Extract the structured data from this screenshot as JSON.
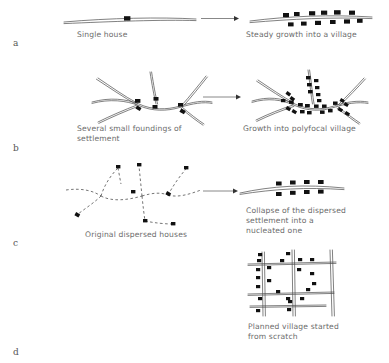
{
  "figure": {
    "background": "#ffffff",
    "ink_color": "#4a4a4a",
    "house_color": "#111111",
    "caption_color": "#6b6b6b",
    "arrow_color": "#6a6a6a"
  },
  "panels": [
    {
      "id": "a",
      "label": "a",
      "label_pos": {
        "x": 13,
        "y": 38
      },
      "before": {
        "caption": "Single house",
        "caption_pos": {
          "x": 77,
          "y": 30
        },
        "house_count": 1,
        "road_type": "solid-double",
        "roads": [
          {
            "d": "M 64 22 C 110 18 160 17 196 19"
          },
          {
            "d": "M 64 23.6 C 112 21.5 162 19.5 196 20.6"
          }
        ],
        "houses": [
          {
            "x": 124,
            "y": 16.2,
            "w": 6.4,
            "h": 4.4,
            "rot": 0
          }
        ]
      },
      "after": {
        "caption": "Steady growth into a village",
        "caption_pos": {
          "x": 246,
          "y": 30
        },
        "house_count": 12,
        "road_type": "solid-double",
        "roads": [
          {
            "d": "M 250 21 C 290 16 330 14.5 372 17"
          },
          {
            "d": "M 250 22.6 C 292 19 332 17 372 18.6"
          }
        ],
        "houses": [
          {
            "x": 283,
            "y": 13.0,
            "w": 6.0,
            "h": 4.2,
            "rot": 0
          },
          {
            "x": 294,
            "y": 12.0,
            "w": 5.6,
            "h": 4.0,
            "rot": 0
          },
          {
            "x": 309,
            "y": 11.2,
            "w": 6.2,
            "h": 4.2,
            "rot": 0
          },
          {
            "x": 321,
            "y": 10.6,
            "w": 6.2,
            "h": 4.2,
            "rot": 0
          },
          {
            "x": 334,
            "y": 10.2,
            "w": 6.6,
            "h": 4.4,
            "rot": 0
          },
          {
            "x": 349,
            "y": 10.6,
            "w": 6.0,
            "h": 4.2,
            "rot": 0
          },
          {
            "x": 288,
            "y": 22.4,
            "w": 5.6,
            "h": 4.0,
            "rot": 0
          },
          {
            "x": 301,
            "y": 21.6,
            "w": 5.6,
            "h": 4.0,
            "rot": 0
          },
          {
            "x": 315,
            "y": 20.8,
            "w": 6.0,
            "h": 4.2,
            "rot": 0
          },
          {
            "x": 330,
            "y": 20.0,
            "w": 5.6,
            "h": 4.0,
            "rot": 0
          },
          {
            "x": 344,
            "y": 19.4,
            "w": 6.0,
            "h": 4.2,
            "rot": 0
          },
          {
            "x": 357,
            "y": 18.8,
            "w": 5.6,
            "h": 4.0,
            "rot": 0
          }
        ]
      },
      "arrow": {
        "x1": 201,
        "y1": 18.5,
        "x2": 239,
        "y2": 18.5
      }
    },
    {
      "id": "b",
      "label": "b",
      "label_pos": {
        "x": 13,
        "y": 143
      },
      "before": {
        "caption": "Several small foundings of\nsettlement",
        "caption_pos": {
          "x": 77,
          "y": 124
        },
        "house_count": 6,
        "road_type": "solid-double-branching",
        "roads": [
          {
            "d": "M 92 102 C 110 97 126 99 139 104 C 152 110 167 110 180 106 C 192 102 204 100 212 102"
          },
          {
            "d": "M 92 103.4 C 110 98.6 126 100.6 139 105.6 C 152 111.4 167 111.4 180 107.4 C 192 103.6 204 101.6 212 103.4"
          },
          {
            "d": "M 98 78 C 110 86 124 96 137 103"
          },
          {
            "d": "M 96.4 79.2 C 109 87.4 123 97 136 104.2"
          },
          {
            "d": "M 150 72 C 152 85 154 96 156 104"
          },
          {
            "d": "M 151.6 72 C 153.6 85 155.6 96 157.6 104"
          },
          {
            "d": "M 206 76 C 198 86 190 96 182 105"
          },
          {
            "d": "M 207.4 77 C 199.4 87 191.4 97 183.4 106"
          },
          {
            "d": "M 98 122 C 110 116 124 110 137 105"
          },
          {
            "d": "M 98.8 123.4 C 111 117.4 125 111.4 138 106.4"
          },
          {
            "d": "M 182 107 C 190 114 198 120 204 124"
          },
          {
            "d": "M 181 108.2 C 189 115.2 197 121.2 203 125.2"
          }
        ],
        "houses": [
          {
            "x": 135,
            "y": 99,
            "w": 5.4,
            "h": 3.8,
            "rot": 0
          },
          {
            "x": 136,
            "y": 106.5,
            "w": 5.0,
            "h": 3.6,
            "rot": 30
          },
          {
            "x": 152.5,
            "y": 105,
            "w": 5.0,
            "h": 3.6,
            "rot": 0
          },
          {
            "x": 153.5,
            "y": 97,
            "w": 5.0,
            "h": 3.6,
            "rot": 0
          },
          {
            "x": 178,
            "y": 103,
            "w": 5.0,
            "h": 3.6,
            "rot": 0
          },
          {
            "x": 180,
            "y": 109.5,
            "w": 5.2,
            "h": 3.8,
            "rot": 30
          }
        ]
      },
      "after": {
        "caption": "Growth into polyfocal village",
        "caption_pos": {
          "x": 243,
          "y": 124
        },
        "house_count": 26,
        "road_type": "solid-double-branching",
        "roads": [
          {
            "d": "M 252 101 C 268 96 282 98 295 104 C 308 110 322 110 334 106 C 346 102 358 100 368 102"
          },
          {
            "d": "M 252 102.4 C 268 97.6 282 99.6 295 105.6 C 308 111.4 322 111.4 334 107.4 C 346 103.6 358 101.6 368 103.4"
          },
          {
            "d": "M 258 80 C 270 88 283 97 294 103"
          },
          {
            "d": "M 256.6 81.2 C 269 89.4 282 98 293 104.2"
          },
          {
            "d": "M 308 70 C 310 84 311 96 312.5 104"
          },
          {
            "d": "M 309.6 70 C 311.6 84 312.6 96 314.1 104"
          },
          {
            "d": "M 364 78 C 356 87 347 96 338 105"
          },
          {
            "d": "M 365.4 79 C 357.4 88 348.4 97 339.4 106"
          },
          {
            "d": "M 256 120 C 268 114 281 109 293 105"
          },
          {
            "d": "M 256.8 121.4 C 269 115.4 282 110.4 294 106.4"
          },
          {
            "d": "M 338 107 C 346 113 354 119 360 123"
          },
          {
            "d": "M 337 108.2 C 345 114.2 353 120.2 359 124.2"
          }
        ],
        "houses": [
          {
            "x": 286,
            "y": 92,
            "w": 4.6,
            "h": 3.4,
            "rot": 35
          },
          {
            "x": 290,
            "y": 97,
            "w": 4.6,
            "h": 3.4,
            "rot": 35
          },
          {
            "x": 281,
            "y": 99,
            "w": 4.4,
            "h": 3.2,
            "rot": 0
          },
          {
            "x": 289,
            "y": 100.5,
            "w": 4.6,
            "h": 3.4,
            "rot": 0
          },
          {
            "x": 286,
            "y": 107,
            "w": 4.6,
            "h": 3.4,
            "rot": 30
          },
          {
            "x": 292,
            "y": 110,
            "w": 4.6,
            "h": 3.4,
            "rot": 30
          },
          {
            "x": 298,
            "y": 103,
            "w": 4.8,
            "h": 3.4,
            "rot": 0
          },
          {
            "x": 305,
            "y": 104,
            "w": 4.8,
            "h": 3.4,
            "rot": 0
          },
          {
            "x": 300,
            "y": 110,
            "w": 4.6,
            "h": 3.4,
            "rot": 0
          },
          {
            "x": 307,
            "y": 111,
            "w": 4.6,
            "h": 3.4,
            "rot": 0
          },
          {
            "x": 306,
            "y": 76,
            "w": 4.6,
            "h": 3.4,
            "rot": 0
          },
          {
            "x": 307,
            "y": 83,
            "w": 4.6,
            "h": 3.4,
            "rot": 0
          },
          {
            "x": 308,
            "y": 90,
            "w": 4.6,
            "h": 3.4,
            "rot": 0
          },
          {
            "x": 314,
            "y": 79,
            "w": 4.4,
            "h": 3.2,
            "rot": 0
          },
          {
            "x": 315,
            "y": 86,
            "w": 4.4,
            "h": 3.2,
            "rot": 0
          },
          {
            "x": 316,
            "y": 93,
            "w": 4.4,
            "h": 3.2,
            "rot": 0
          },
          {
            "x": 317,
            "y": 99,
            "w": 4.4,
            "h": 3.2,
            "rot": 0
          },
          {
            "x": 314,
            "y": 104.5,
            "w": 4.6,
            "h": 3.4,
            "rot": 0
          },
          {
            "x": 322,
            "y": 104.5,
            "w": 4.6,
            "h": 3.4,
            "rot": 0
          },
          {
            "x": 320,
            "y": 110.5,
            "w": 4.6,
            "h": 3.4,
            "rot": 0
          },
          {
            "x": 328,
            "y": 109,
            "w": 4.6,
            "h": 3.4,
            "rot": 0
          },
          {
            "x": 333,
            "y": 101.5,
            "w": 4.6,
            "h": 3.4,
            "rot": 0
          },
          {
            "x": 340,
            "y": 99,
            "w": 4.4,
            "h": 3.2,
            "rot": 30
          },
          {
            "x": 344,
            "y": 103,
            "w": 4.4,
            "h": 3.2,
            "rot": 30
          },
          {
            "x": 338,
            "y": 108,
            "w": 4.6,
            "h": 3.4,
            "rot": 30
          },
          {
            "x": 345,
            "y": 112,
            "w": 4.6,
            "h": 3.4,
            "rot": 30
          }
        ]
      },
      "arrow": {
        "x1": 203,
        "y1": 97,
        "x2": 241,
        "y2": 97
      }
    },
    {
      "id": "c",
      "label": "c",
      "label_pos": {
        "x": 13,
        "y": 238
      },
      "before": {
        "caption": "Original dispersed houses",
        "caption_pos": {
          "x": 85,
          "y": 230
        },
        "house_count": 8,
        "road_type": "dashed-paths",
        "paths": [
          {
            "d": "M 66 190 C 80 188 92 190 101 196"
          },
          {
            "d": "M 101 196 C 112 202 128 200 142 196"
          },
          {
            "d": "M 142 196 C 152 193 160 192 168 195"
          },
          {
            "d": "M 168 195 C 178 198 190 194 201 190"
          },
          {
            "d": "M 101 196 C 104 186 110 176 118 168"
          },
          {
            "d": "M 101 196 C 95 202 86 208 78 214"
          },
          {
            "d": "M 142 196 C 141 186 140 176 139 166"
          },
          {
            "d": "M 142 196 C 143 206 144 214 145 221"
          },
          {
            "d": "M 168 195 C 173 186 179 177 186 169"
          },
          {
            "d": "M 145 221 C 155 223 165 224 173 224"
          },
          {
            "d": "M 118 168 C 119 173 120 179 121 184"
          }
        ],
        "houses": [
          {
            "x": 116,
            "y": 165,
            "w": 4.4,
            "h": 3.4,
            "rot": 0
          },
          {
            "x": 137,
            "y": 163,
            "w": 4.4,
            "h": 3.4,
            "rot": 0
          },
          {
            "x": 184,
            "y": 166,
            "w": 4.4,
            "h": 3.4,
            "rot": 0
          },
          {
            "x": 131,
            "y": 190,
            "w": 4.4,
            "h": 3.4,
            "rot": 0
          },
          {
            "x": 166,
            "y": 192,
            "w": 4.6,
            "h": 3.6,
            "rot": 30
          },
          {
            "x": 75,
            "y": 213,
            "w": 4.6,
            "h": 3.6,
            "rot": 30
          },
          {
            "x": 143,
            "y": 219,
            "w": 4.4,
            "h": 3.4,
            "rot": 0
          },
          {
            "x": 171,
            "y": 222,
            "w": 4.4,
            "h": 3.4,
            "rot": 0
          }
        ]
      },
      "after": {
        "caption": "Collapse of the dispersed\nsettlement into a\nnucleated one",
        "caption_pos": {
          "x": 246,
          "y": 206
        },
        "house_count": 8,
        "road_type": "solid-double",
        "roads": [
          {
            "d": "M 240 193 C 272 186 304 184 344 188"
          },
          {
            "d": "M 240 194.4 C 274 189 306 187 344 189.6"
          }
        ],
        "houses": [
          {
            "x": 276,
            "y": 181.5,
            "w": 5.6,
            "h": 4.0,
            "rot": 0
          },
          {
            "x": 290,
            "y": 180.5,
            "w": 5.6,
            "h": 4.0,
            "rot": 0
          },
          {
            "x": 304,
            "y": 180.0,
            "w": 5.6,
            "h": 4.0,
            "rot": 0
          },
          {
            "x": 318,
            "y": 180.0,
            "w": 5.6,
            "h": 4.0,
            "rot": 0
          },
          {
            "x": 276,
            "y": 192.0,
            "w": 5.6,
            "h": 4.0,
            "rot": 0
          },
          {
            "x": 290,
            "y": 190.8,
            "w": 5.6,
            "h": 4.0,
            "rot": 0
          },
          {
            "x": 304,
            "y": 190.0,
            "w": 5.6,
            "h": 4.0,
            "rot": 0
          },
          {
            "x": 318,
            "y": 189.6,
            "w": 5.6,
            "h": 4.0,
            "rot": 0
          }
        ]
      },
      "arrow": {
        "x1": 203,
        "y1": 191,
        "x2": 238,
        "y2": 191
      }
    },
    {
      "id": "d",
      "label": "d",
      "label_pos": {
        "x": 13,
        "y": 347
      },
      "before": null,
      "after": {
        "caption": "Planned village started\nfrom scratch",
        "caption_pos": {
          "x": 248,
          "y": 322
        },
        "house_count": 22,
        "road_type": "planned-grid",
        "roads": [
          {
            "d": "M 262 252 L 263 316"
          },
          {
            "d": "M 264.4 252 L 265.4 316"
          },
          {
            "d": "M 292 250 L 293 316"
          },
          {
            "d": "M 294.4 250 L 295.4 316"
          },
          {
            "d": "M 330 250 L 332 316"
          },
          {
            "d": "M 332.4 250 L 334.4 316"
          },
          {
            "d": "M 248 264 L 336 262"
          },
          {
            "d": "M 248 265.4 L 336 263.4"
          },
          {
            "d": "M 248 294 L 334 292"
          },
          {
            "d": "M 248 295.4 L 334 293.4"
          },
          {
            "d": "M 250 306 L 326 305"
          },
          {
            "d": "M 250 307.4 L 326 306.4"
          }
        ],
        "houses": [
          {
            "x": 258,
            "y": 253,
            "w": 4.2,
            "h": 3.2,
            "rot": 0
          },
          {
            "x": 257,
            "y": 259,
            "w": 4.2,
            "h": 3.2,
            "rot": 0
          },
          {
            "x": 267,
            "y": 266,
            "w": 4.2,
            "h": 3.2,
            "rot": 0
          },
          {
            "x": 256,
            "y": 268,
            "w": 4.2,
            "h": 3.2,
            "rot": 0
          },
          {
            "x": 256,
            "y": 276,
            "w": 4.2,
            "h": 3.2,
            "rot": 0
          },
          {
            "x": 267,
            "y": 279,
            "w": 4.2,
            "h": 3.2,
            "rot": 0
          },
          {
            "x": 256,
            "y": 285,
            "w": 4.2,
            "h": 3.2,
            "rot": 0
          },
          {
            "x": 276,
            "y": 290,
            "w": 4.2,
            "h": 3.2,
            "rot": 0
          },
          {
            "x": 286,
            "y": 252,
            "w": 4.2,
            "h": 3.2,
            "rot": 0
          },
          {
            "x": 280,
            "y": 259,
            "w": 4.2,
            "h": 3.2,
            "rot": 0
          },
          {
            "x": 298,
            "y": 258,
            "w": 4.2,
            "h": 3.2,
            "rot": 0
          },
          {
            "x": 310,
            "y": 258,
            "w": 4.2,
            "h": 3.2,
            "rot": 0
          },
          {
            "x": 297,
            "y": 268,
            "w": 4.2,
            "h": 3.2,
            "rot": 0
          },
          {
            "x": 310,
            "y": 272,
            "w": 4.2,
            "h": 3.2,
            "rot": 0
          },
          {
            "x": 312,
            "y": 282,
            "w": 4.2,
            "h": 3.2,
            "rot": 0
          },
          {
            "x": 306,
            "y": 288,
            "w": 4.2,
            "h": 3.2,
            "rot": 0
          },
          {
            "x": 286,
            "y": 297,
            "w": 4.2,
            "h": 3.2,
            "rot": 0
          },
          {
            "x": 300,
            "y": 297,
            "w": 4.2,
            "h": 3.2,
            "rot": 0
          },
          {
            "x": 258,
            "y": 297,
            "w": 4.2,
            "h": 3.2,
            "rot": 0
          },
          {
            "x": 256,
            "y": 309,
            "w": 4.2,
            "h": 3.2,
            "rot": 0
          },
          {
            "x": 287,
            "y": 308,
            "w": 4.2,
            "h": 3.2,
            "rot": 0
          },
          {
            "x": 288,
            "y": 300,
            "w": 4.2,
            "h": 3.2,
            "rot": 0
          }
        ]
      },
      "arrow": null
    }
  ]
}
